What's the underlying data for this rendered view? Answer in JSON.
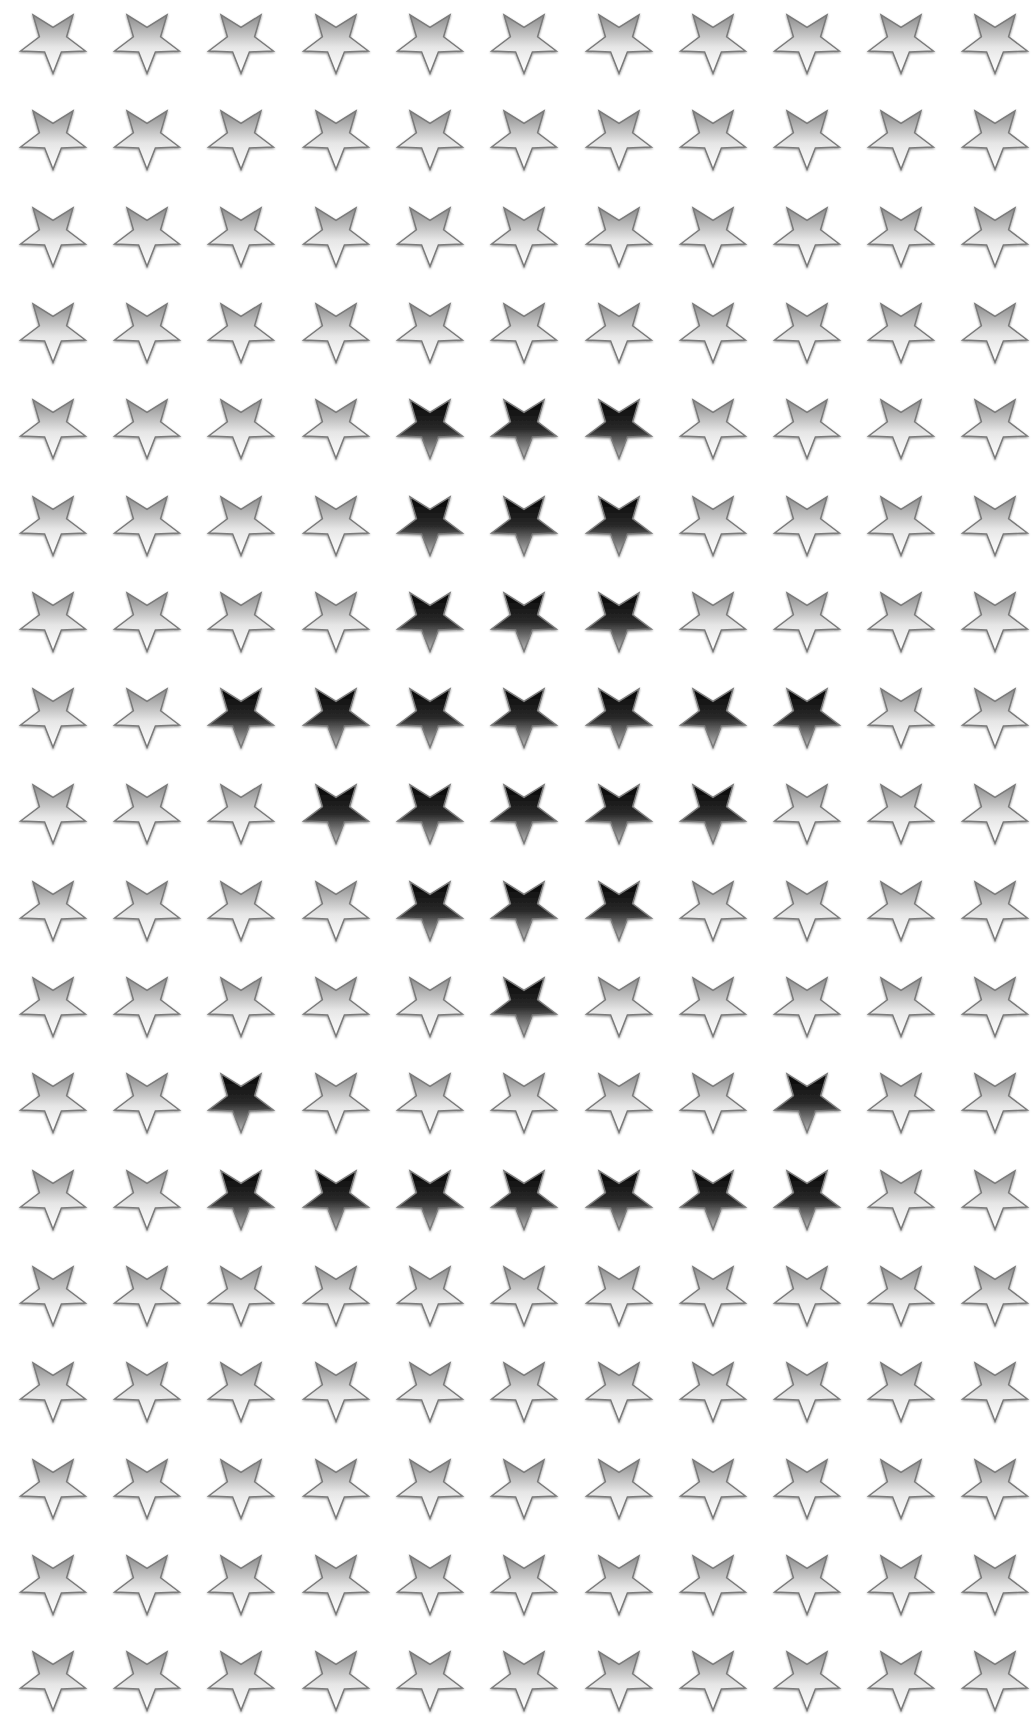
{
  "pattern": {
    "title": "Star grid pattern",
    "columns": 11,
    "rows": 18,
    "col_centers_x": [
      53,
      147,
      241,
      336,
      430,
      524,
      619,
      713,
      807,
      901,
      995
    ],
    "row_top_y": 8,
    "row_pitch": 96.3,
    "star_width": 68,
    "star_height": 66,
    "colors": {
      "background": "#ffffff",
      "light_top": "#8e8e8e",
      "light_bottom": "#ffffff",
      "dark_top": "#050505",
      "dark_bottom": "#b5b5b5",
      "outline": "#7a7a7a"
    },
    "dark_cells": [
      [
        4,
        4
      ],
      [
        4,
        5
      ],
      [
        4,
        6
      ],
      [
        5,
        4
      ],
      [
        5,
        5
      ],
      [
        5,
        6
      ],
      [
        6,
        4
      ],
      [
        6,
        5
      ],
      [
        6,
        6
      ],
      [
        7,
        2
      ],
      [
        7,
        3
      ],
      [
        7,
        4
      ],
      [
        7,
        5
      ],
      [
        7,
        6
      ],
      [
        7,
        7
      ],
      [
        7,
        8
      ],
      [
        8,
        3
      ],
      [
        8,
        4
      ],
      [
        8,
        5
      ],
      [
        8,
        6
      ],
      [
        8,
        7
      ],
      [
        9,
        4
      ],
      [
        9,
        5
      ],
      [
        9,
        6
      ],
      [
        10,
        5
      ],
      [
        11,
        2
      ],
      [
        11,
        8
      ],
      [
        12,
        2
      ],
      [
        12,
        3
      ],
      [
        12,
        4
      ],
      [
        12,
        5
      ],
      [
        12,
        6
      ],
      [
        12,
        7
      ],
      [
        12,
        8
      ]
    ]
  }
}
